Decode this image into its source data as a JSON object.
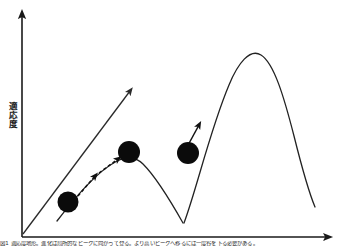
{
  "figure": {
    "title": "",
    "y_axis_label": "適応度",
    "x_axis_label": "",
    "caption": "図1 適応度地形。進化は局所的なピークに向かって登る。より高いピークへ移るには一度谷を下る必要がある。"
  },
  "chart_data": {
    "type": "line",
    "title": "適応度地形",
    "xlabel": "",
    "ylabel": "適応度",
    "grid": false,
    "legend": false,
    "axis_arrowheads": {
      "x": true,
      "y": true
    },
    "series": [
      {
        "name": "local-peak-curve",
        "description": "左の低い丘（局所的最適）",
        "style": "solid",
        "points": [
          [
            60,
            216
          ],
          [
            72,
            200
          ],
          [
            88,
            181
          ],
          [
            104,
            168
          ],
          [
            118,
            160
          ],
          [
            130,
            158
          ],
          [
            144,
            163
          ],
          [
            158,
            177
          ],
          [
            170,
            196
          ],
          [
            180,
            213
          ],
          [
            185,
            222
          ]
        ]
      },
      {
        "name": "global-peak-curve",
        "description": "右の高い丘（大域的最適）",
        "style": "solid",
        "points": [
          [
            184,
            222
          ],
          [
            196,
            190
          ],
          [
            208,
            148
          ],
          [
            220,
            108
          ],
          [
            232,
            77
          ],
          [
            244,
            58
          ],
          [
            254,
            52
          ],
          [
            266,
            57
          ],
          [
            278,
            76
          ],
          [
            290,
            110
          ],
          [
            300,
            146
          ],
          [
            310,
            178
          ],
          [
            316,
            196
          ]
        ]
      }
    ],
    "markers": [
      {
        "name": "ball-start",
        "x": 68,
        "y": 202,
        "r": 10.5,
        "color": "#0b0b0b"
      },
      {
        "name": "ball-local-peak",
        "x": 129,
        "y": 152,
        "r": 11.0,
        "color": "#0b0b0b"
      },
      {
        "name": "ball-global-slope",
        "x": 188,
        "y": 153,
        "r": 11.0,
        "color": "#0b0b0b"
      }
    ],
    "annotations": [
      {
        "name": "overall-trend-arrow",
        "style": "solid",
        "from": [
          22,
          234
        ],
        "to": [
          133,
          88
        ],
        "description": "全体として上昇する進化の方向"
      },
      {
        "name": "hill-climb-arrow-1",
        "style": "dashed",
        "from": [
          79,
          195
        ],
        "to": [
          97,
          174
        ],
        "description": "丘を登る一歩目"
      },
      {
        "name": "hill-climb-arrow-2",
        "style": "dashed",
        "from": [
          100,
          172
        ],
        "to": [
          120,
          158
        ],
        "description": "丘を登る二歩目"
      },
      {
        "name": "global-climb-arrow",
        "style": "solid",
        "from": [
          188,
          146
        ],
        "to": [
          200,
          123
        ],
        "description": "より高い丘を登る"
      }
    ],
    "axes": {
      "y": {
        "x": 22,
        "y_top": 12,
        "y_bottom": 237
      },
      "x": {
        "y": 237,
        "x_left": 22,
        "x_right": 332
      }
    }
  }
}
